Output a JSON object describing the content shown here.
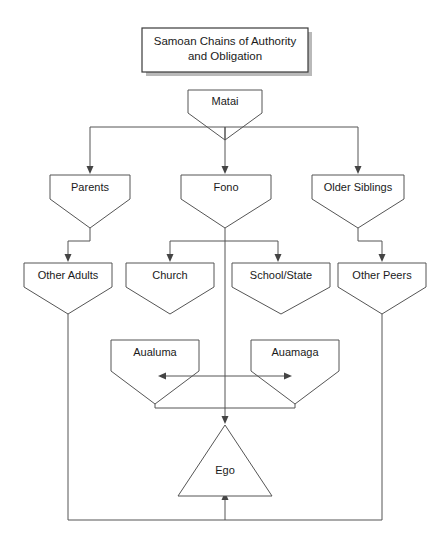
{
  "diagram": {
    "title_line1": "Samoan Chains of Authority",
    "title_line2": "and Obligation",
    "nodes": {
      "matai": "Matai",
      "parents": "Parents",
      "fono": "Fono",
      "older_siblings": "Older Siblings",
      "other_adults": "Other Adults",
      "church": "Church",
      "school_state": "School/State",
      "other_peers": "Other Peers",
      "aualuma": "Aualuma",
      "auamaga": "Auamaga",
      "ego": "Ego"
    },
    "colors": {
      "node_stroke": "#555555",
      "node_fill": "#ffffff",
      "title_stroke": "#3a3a3a",
      "shadow": "#b9b9b9",
      "text": "#1a1a1a",
      "background": "#ffffff"
    }
  }
}
